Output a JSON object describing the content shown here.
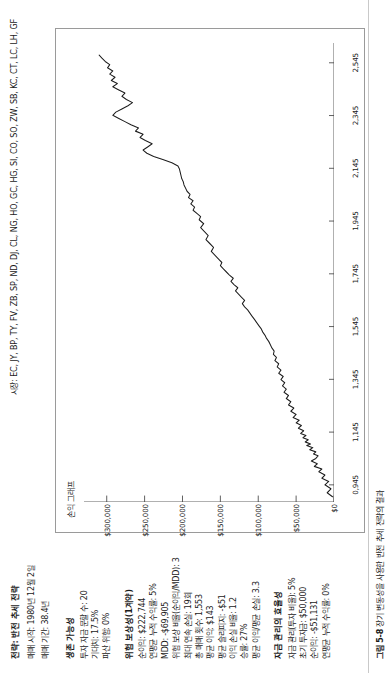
{
  "header": {
    "strategy_title": "전략: 반전 추세 전략",
    "start_line": "매매 시작: 1980년 12월 2일",
    "period_line": "매매 기간: 38.4년",
    "markets_line": "시장: EC, JY, BP, TY, FV, ZB, SP, ND, DJ, CL, NG, HO, GC, HG, SI, CO, SO, ZW, SB, KC, CT, LC, LH, GF"
  },
  "stats": {
    "groups": [
      {
        "heading": "생존 가능성",
        "items": [
          "투자 자금 문할 수: 20",
          "기대치: 17.5%",
          "파산 위험: 0%"
        ]
      },
      {
        "heading": "위험 보상성(1계약)",
        "items": [
          "순이익: $222,744",
          "연평균 누적 수익률: 5%",
          "MDD: -$69,905",
          "위험 보상 비율(순이익/MDD): 3",
          "최대 연속 손실: 19회",
          "총 매매 횟수: 1,553",
          "평균 이익: $143",
          "평균 슬리피지: -$51",
          "이익 손실 비율: 1.2",
          "승률: 27%",
          "평균 이익/평균 손실: 3.3"
        ]
      },
      {
        "heading": "자금 관리의 효율성",
        "items": [
          "자금 관리(투자 비율): 5%",
          "초기 투자금: $50,000",
          "순이익: -$51,131",
          "연평균 누적 수익률: 0%"
        ]
      }
    ]
  },
  "caption": {
    "figure_number": "그림 5-8",
    "text": "장기 변동성을 사용한 반전 추세 전략의 결과"
  },
  "chart_data": {
    "type": "line",
    "title": "손익 그래프",
    "xlabel": "",
    "ylabel": "",
    "grid": false,
    "legend": null,
    "series_color": "#1a1a1a",
    "xtick_labels": [
      "0,945",
      "1,145",
      "1,345",
      "1,545",
      "1,745",
      "1,945",
      "2,145",
      "2,345",
      "2,545"
    ],
    "xtick_values": [
      945,
      1145,
      1345,
      1545,
      1745,
      1945,
      2145,
      2345,
      2545
    ],
    "xlim": [
      880,
      2620
    ],
    "ytick_labels": [
      "$0",
      "$50,000",
      "$100,000",
      "$150,000",
      "$200,000",
      "$250,000",
      "$300,000"
    ],
    "ytick_values": [
      0,
      50000,
      100000,
      150000,
      200000,
      250000,
      300000
    ],
    "ylim": [
      0,
      330000
    ],
    "x": [
      900,
      915,
      930,
      945,
      958,
      970,
      982,
      995,
      1005,
      1015,
      1025,
      1035,
      1045,
      1055,
      1062,
      1070,
      1078,
      1086,
      1094,
      1100,
      1108,
      1116,
      1124,
      1132,
      1140,
      1150,
      1160,
      1170,
      1180,
      1190,
      1200,
      1212,
      1224,
      1236,
      1248,
      1260,
      1272,
      1284,
      1296,
      1308,
      1320,
      1332,
      1344,
      1356,
      1368,
      1380,
      1392,
      1404,
      1416,
      1428,
      1440,
      1452,
      1464,
      1476,
      1488,
      1500,
      1512,
      1524,
      1536,
      1548,
      1560,
      1572,
      1584,
      1596,
      1608,
      1620,
      1632,
      1644,
      1656,
      1668,
      1680,
      1692,
      1704,
      1716,
      1728,
      1740,
      1752,
      1764,
      1776,
      1788,
      1800,
      1815,
      1830,
      1845,
      1860,
      1875,
      1890,
      1905,
      1920,
      1935,
      1950,
      1962,
      1974,
      1986,
      1998,
      2010,
      2022,
      2034,
      2046,
      2058,
      2070,
      2082,
      2094,
      2106,
      2118,
      2130,
      2142,
      2154,
      2166,
      2178,
      2190,
      2202,
      2214,
      2226,
      2238,
      2250,
      2262,
      2274,
      2286,
      2298,
      2310,
      2322,
      2334,
      2346,
      2358,
      2370,
      2382,
      2394,
      2406,
      2418,
      2430,
      2442,
      2454,
      2466,
      2478,
      2490,
      2502,
      2514,
      2526,
      2538,
      2550,
      2562,
      2574,
      2586
    ],
    "y": [
      2000,
      9000,
      4000,
      12000,
      7000,
      16000,
      12000,
      20000,
      16000,
      26000,
      22000,
      30000,
      24000,
      21000,
      27000,
      24000,
      32000,
      28000,
      36000,
      31000,
      38000,
      34000,
      41000,
      37000,
      44000,
      40000,
      47000,
      43000,
      50000,
      46000,
      54000,
      50000,
      57000,
      53000,
      60000,
      57000,
      63000,
      60000,
      66000,
      63000,
      68000,
      65000,
      70000,
      67000,
      73000,
      70000,
      75000,
      73000,
      78000,
      76000,
      80000,
      79000,
      82000,
      84000,
      86000,
      89000,
      91000,
      94000,
      96000,
      99000,
      102000,
      105000,
      108000,
      111000,
      114000,
      118000,
      121000,
      118000,
      122000,
      126000,
      130000,
      127000,
      132000,
      136000,
      133000,
      138000,
      142000,
      146000,
      150000,
      148000,
      152000,
      157000,
      162000,
      159000,
      164000,
      169000,
      166000,
      171000,
      176000,
      172000,
      178000,
      176000,
      181000,
      186000,
      184000,
      189000,
      186000,
      192000,
      190000,
      194000,
      196000,
      198000,
      199000,
      201000,
      202000,
      203000,
      204000,
      206000,
      214000,
      226000,
      238000,
      247000,
      252000,
      246000,
      240000,
      249000,
      256000,
      252000,
      262000,
      258000,
      268000,
      276000,
      284000,
      292000,
      288000,
      280000,
      272000,
      266000,
      274000,
      280000,
      276000,
      284000,
      292000,
      286000,
      294000,
      289000,
      296000,
      292000,
      299000,
      296000,
      302000,
      306000,
      310000
    ]
  }
}
